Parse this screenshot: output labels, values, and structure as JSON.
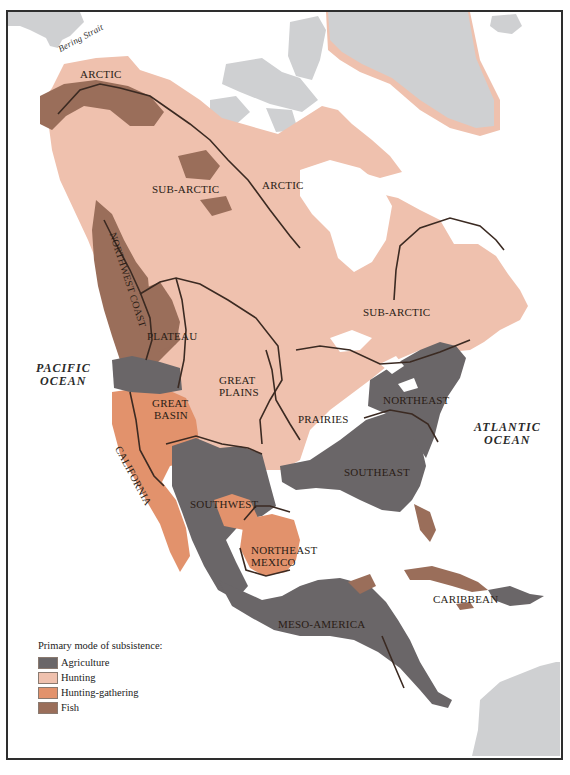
{
  "map": {
    "title": "Culture areas of North America",
    "colors": {
      "agriculture": "#6a6668",
      "hunting": "#efc1ae",
      "hunting_gathering": "#e2926c",
      "fish": "#9a6e5a",
      "other_land": "#cfd0d2",
      "water": "#ffffff",
      "boundary": "#3b2a22"
    },
    "regions": [
      {
        "name": "ARCTIC",
        "subsistence": "Hunting"
      },
      {
        "name": "ARCTIC",
        "subsistence": "Hunting"
      },
      {
        "name": "SUB-ARCTIC",
        "subsistence": "Hunting"
      },
      {
        "name": "SUB-ARCTIC",
        "subsistence": "Hunting"
      },
      {
        "name": "NORTHWEST COAST",
        "subsistence": "Fish"
      },
      {
        "name": "PLATEAU",
        "subsistence": "Fish"
      },
      {
        "name": "GREAT PLAINS",
        "subsistence": "Hunting"
      },
      {
        "name": "PRAIRIES",
        "subsistence": "Hunting"
      },
      {
        "name": "GREAT BASIN",
        "subsistence": "Hunting-gathering"
      },
      {
        "name": "CALIFORNIA",
        "subsistence": "Hunting-gathering"
      },
      {
        "name": "SOUTHWEST",
        "subsistence": "Agriculture"
      },
      {
        "name": "NORTHEAST MEXICO",
        "subsistence": "Hunting-gathering"
      },
      {
        "name": "NORTHEAST",
        "subsistence": "Agriculture"
      },
      {
        "name": "SOUTHEAST",
        "subsistence": "Agriculture"
      },
      {
        "name": "MESO-AMERICA",
        "subsistence": "Agriculture"
      },
      {
        "name": "CARIBBEAN",
        "subsistence": "Agriculture"
      }
    ],
    "labels": {
      "bering_strait": "Bering Strait",
      "arctic_west": "ARCTIC",
      "arctic_east": "ARCTIC",
      "subarctic_west": "SUB-ARCTIC",
      "subarctic_east": "SUB-ARCTIC",
      "northwest_coast": "NORTHWEST COAST",
      "plateau": "PLATEAU",
      "great_plains_1": "GREAT",
      "great_plains_2": "PLAINS",
      "great_basin_1": "GREAT",
      "great_basin_2": "BASIN",
      "prairies": "PRAIRIES",
      "california": "CALIFORNIA",
      "southwest": "SOUTHWEST",
      "ne_mexico_1": "NORTHEAST",
      "ne_mexico_2": "MEXICO",
      "northeast": "NORTHEAST",
      "southeast": "SOUTHEAST",
      "meso_america": "MESO-AMERICA",
      "caribbean": "CARIBBEAN",
      "pacific_1": "PACIFIC",
      "pacific_2": "OCEAN",
      "atlantic_1": "ATLANTIC",
      "atlantic_2": "OCEAN"
    }
  },
  "legend": {
    "title": "Primary mode of subsistence:",
    "items": [
      {
        "label": "Agriculture",
        "color": "#6a6668"
      },
      {
        "label": "Hunting",
        "color": "#efc1ae"
      },
      {
        "label": "Hunting-gathering",
        "color": "#e2926c"
      },
      {
        "label": "Fish",
        "color": "#9a6e5a"
      }
    ]
  }
}
